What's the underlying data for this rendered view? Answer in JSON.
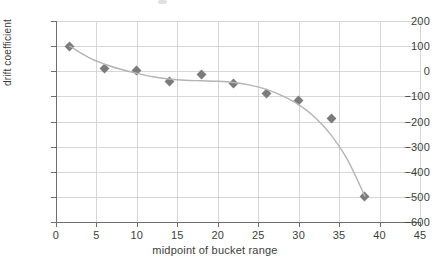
{
  "chart_data": {
    "type": "scatter",
    "title": "",
    "xlabel": "midpoint of bucket range",
    "ylabel": "drift coefficient",
    "xlim": [
      0,
      45
    ],
    "ylim": [
      -600,
      200
    ],
    "xticks": [
      0,
      5,
      10,
      15,
      20,
      25,
      30,
      35,
      40,
      45
    ],
    "yticks": [
      200,
      100,
      0,
      -100,
      -200,
      -300,
      -400,
      -500,
      -600
    ],
    "xtick_labels": [
      "0",
      "5",
      "10",
      "15",
      "20",
      "25",
      "30",
      "35",
      "40",
      "45"
    ],
    "ytick_labels": [
      "200",
      "100",
      "0",
      "−100",
      "−200",
      "−300",
      "−400",
      "−500",
      "−600"
    ],
    "grid": true,
    "legend": null,
    "marker_color": "#7b7b7b",
    "marker_shape": "diamond",
    "line_color": "#b4b4b4",
    "grid_color": "#d6d6d6",
    "axis_color": "#6e6e6e",
    "x": [
      1.7,
      6.0,
      10.0,
      14.0,
      18.0,
      22.0,
      26.0,
      30.0,
      34.0,
      38.2
    ],
    "values": [
      100,
      12,
      2,
      -42,
      -12,
      -48,
      -90,
      -118,
      -188,
      -500
    ],
    "points": [
      {
        "x": 1.7,
        "y": 100
      },
      {
        "x": 6.0,
        "y": 12
      },
      {
        "x": 10.0,
        "y": 2
      },
      {
        "x": 14.0,
        "y": -42
      },
      {
        "x": 18.0,
        "y": -12
      },
      {
        "x": 22.0,
        "y": -48
      },
      {
        "x": 26.0,
        "y": -90
      },
      {
        "x": 30.0,
        "y": -118
      },
      {
        "x": 34.0,
        "y": -188
      },
      {
        "x": 38.2,
        "y": -500
      }
    ],
    "trend_line": {
      "description": "smooth fitted curve through the points",
      "x": [
        1.7,
        4,
        6,
        8,
        10,
        12,
        14,
        16,
        18,
        20,
        22,
        24,
        26,
        28,
        30,
        32,
        34,
        36,
        38.2
      ],
      "y": [
        100,
        55,
        28,
        8,
        -8,
        -22,
        -31,
        -36,
        -38,
        -40,
        -45,
        -55,
        -72,
        -98,
        -133,
        -183,
        -253,
        -350,
        -498
      ]
    }
  }
}
